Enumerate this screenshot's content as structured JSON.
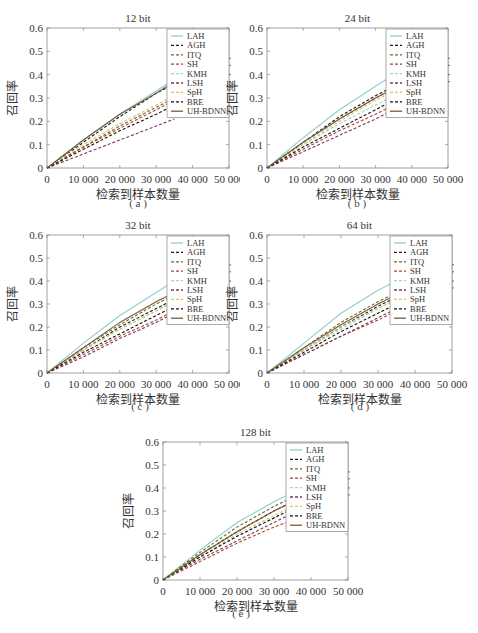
{
  "figure": {
    "legend_order": [
      "LAH",
      "AGH",
      "ITQ",
      "SH",
      "KMH",
      "LSH",
      "SpH",
      "BRE",
      "UH-BDNN"
    ]
  },
  "styles": {
    "LAH": {
      "color": "#8fcfc8",
      "dash": ""
    },
    "AGH": {
      "color": "#1a1a1a",
      "dash": "3,2"
    },
    "ITQ": {
      "color": "#6b6b2a",
      "dash": "3,2"
    },
    "SH": {
      "color": "#b0402a",
      "dash": "3,2"
    },
    "KMH": {
      "color": "#9fd2d8",
      "dash": "3,2"
    },
    "LSH": {
      "color": "#7a3a5a",
      "dash": "3,2"
    },
    "SpH": {
      "color": "#d6c66a",
      "dash": "3,2"
    },
    "BRE": {
      "color": "#111111",
      "dash": "3,2"
    },
    "UH-BDNN": {
      "color": "#7a5a3a",
      "dash": ""
    }
  },
  "chart_data": [
    {
      "type": "line",
      "panel": "a",
      "title": "12 bit",
      "caption": "( a )",
      "xlabel": "检索到样本数量",
      "ylabel": "召回率",
      "xlim": [
        0,
        50000
      ],
      "ylim": [
        0,
        0.6
      ],
      "xticks": [
        "0",
        "10 000",
        "20 000",
        "30 000",
        "40 000",
        "50 000"
      ],
      "yticks": [
        "0",
        "0.1",
        "0.2",
        "0.3",
        "0.4",
        "0.5",
        "0.6"
      ],
      "x": [
        0,
        10000,
        20000,
        30000,
        35000
      ],
      "series": [
        {
          "name": "LAH",
          "values": [
            0,
            0.12,
            0.23,
            0.33,
            0.38
          ]
        },
        {
          "name": "AGH",
          "values": [
            0,
            0.11,
            0.22,
            0.32,
            0.36
          ]
        },
        {
          "name": "ITQ",
          "values": [
            0,
            0.09,
            0.18,
            0.26,
            0.3
          ]
        },
        {
          "name": "SH",
          "values": [
            0,
            0.09,
            0.17,
            0.25,
            0.29
          ]
        },
        {
          "name": "KMH",
          "values": [
            0,
            0.12,
            0.23,
            0.33,
            0.37
          ]
        },
        {
          "name": "LSH",
          "values": [
            0,
            0.06,
            0.12,
            0.18,
            0.21
          ]
        },
        {
          "name": "SpH",
          "values": [
            0,
            0.1,
            0.19,
            0.27,
            0.31
          ]
        },
        {
          "name": "BRE",
          "values": [
            0,
            0.08,
            0.16,
            0.23,
            0.27
          ]
        },
        {
          "name": "UH-BDNN",
          "values": [
            0,
            0.12,
            0.23,
            0.32,
            0.37
          ]
        }
      ]
    },
    {
      "type": "line",
      "panel": "b",
      "title": "24 bit",
      "caption": "( b )",
      "xlabel": "检索到样本数量",
      "ylabel": "召回率",
      "xlim": [
        0,
        50000
      ],
      "ylim": [
        0,
        0.6
      ],
      "xticks": [
        "0",
        "10 000",
        "20 000",
        "30 000",
        "40 000",
        "50 000"
      ],
      "yticks": [
        "0",
        "0.1",
        "0.2",
        "0.3",
        "0.4",
        "0.5",
        "0.6"
      ],
      "x": [
        0,
        10000,
        20000,
        30000,
        35000
      ],
      "series": [
        {
          "name": "LAH",
          "values": [
            0,
            0.13,
            0.25,
            0.35,
            0.4
          ]
        },
        {
          "name": "AGH",
          "values": [
            0,
            0.11,
            0.22,
            0.31,
            0.35
          ]
        },
        {
          "name": "ITQ",
          "values": [
            0,
            0.11,
            0.21,
            0.3,
            0.34
          ]
        },
        {
          "name": "SH",
          "values": [
            0,
            0.08,
            0.16,
            0.23,
            0.27
          ]
        },
        {
          "name": "KMH",
          "values": [
            0,
            0.1,
            0.19,
            0.27,
            0.31
          ]
        },
        {
          "name": "LSH",
          "values": [
            0,
            0.07,
            0.14,
            0.21,
            0.25
          ]
        },
        {
          "name": "SpH",
          "values": [
            0,
            0.1,
            0.2,
            0.29,
            0.33
          ]
        },
        {
          "name": "BRE",
          "values": [
            0,
            0.09,
            0.17,
            0.25,
            0.29
          ]
        },
        {
          "name": "UH-BDNN",
          "values": [
            0,
            0.11,
            0.21,
            0.3,
            0.34
          ]
        }
      ]
    },
    {
      "type": "line",
      "panel": "c",
      "title": "32 bit",
      "caption": "( c )",
      "xlabel": "检索到样本数量",
      "ylabel": "召回率",
      "xlim": [
        0,
        50000
      ],
      "ylim": [
        0,
        0.6
      ],
      "xticks": [
        "0",
        "10 000",
        "20 000",
        "30 000",
        "40 000",
        "50 000"
      ],
      "yticks": [
        "0",
        "0.1",
        "0.2",
        "0.3",
        "0.4",
        "0.5",
        "0.6"
      ],
      "x": [
        0,
        10000,
        20000,
        30000,
        35000
      ],
      "series": [
        {
          "name": "LAH",
          "values": [
            0,
            0.13,
            0.25,
            0.35,
            0.4
          ]
        },
        {
          "name": "AGH",
          "values": [
            0,
            0.1,
            0.2,
            0.28,
            0.32
          ]
        },
        {
          "name": "ITQ",
          "values": [
            0,
            0.11,
            0.21,
            0.3,
            0.34
          ]
        },
        {
          "name": "SH",
          "values": [
            0,
            0.08,
            0.16,
            0.23,
            0.27
          ]
        },
        {
          "name": "KMH",
          "values": [
            0,
            0.1,
            0.19,
            0.27,
            0.31
          ]
        },
        {
          "name": "LSH",
          "values": [
            0,
            0.07,
            0.15,
            0.22,
            0.26
          ]
        },
        {
          "name": "SpH",
          "values": [
            0,
            0.1,
            0.19,
            0.27,
            0.31
          ]
        },
        {
          "name": "BRE",
          "values": [
            0,
            0.09,
            0.17,
            0.25,
            0.29
          ]
        },
        {
          "name": "UH-BDNN",
          "values": [
            0,
            0.11,
            0.22,
            0.31,
            0.35
          ]
        }
      ]
    },
    {
      "type": "line",
      "panel": "d",
      "title": "64 bit",
      "caption": "( d )",
      "xlabel": "检索到样本数量",
      "ylabel": "召回率",
      "xlim": [
        0,
        50000
      ],
      "ylim": [
        0,
        0.6
      ],
      "xticks": [
        "0",
        "10 000",
        "20 000",
        "30 000",
        "40 000",
        "50 000"
      ],
      "yticks": [
        "0",
        "0.1",
        "0.2",
        "0.3",
        "0.4",
        "0.5",
        "0.6"
      ],
      "x": [
        0,
        10000,
        20000,
        30000,
        35000
      ],
      "series": [
        {
          "name": "LAH",
          "values": [
            0,
            0.13,
            0.26,
            0.36,
            0.4
          ]
        },
        {
          "name": "AGH",
          "values": [
            0,
            0.1,
            0.2,
            0.29,
            0.33
          ]
        },
        {
          "name": "ITQ",
          "values": [
            0,
            0.11,
            0.22,
            0.31,
            0.35
          ]
        },
        {
          "name": "SH",
          "values": [
            0,
            0.08,
            0.16,
            0.23,
            0.27
          ]
        },
        {
          "name": "KMH",
          "values": [
            0,
            0.1,
            0.19,
            0.28,
            0.32
          ]
        },
        {
          "name": "LSH",
          "values": [
            0,
            0.08,
            0.16,
            0.24,
            0.28
          ]
        },
        {
          "name": "SpH",
          "values": [
            0,
            0.1,
            0.2,
            0.28,
            0.32
          ]
        },
        {
          "name": "BRE",
          "values": [
            0,
            0.09,
            0.18,
            0.26,
            0.3
          ]
        },
        {
          "name": "UH-BDNN",
          "values": [
            0,
            0.11,
            0.21,
            0.3,
            0.34
          ]
        }
      ]
    },
    {
      "type": "line",
      "panel": "e",
      "title": "128 bit",
      "caption": "( e )",
      "xlabel": "检索到样本数量",
      "ylabel": "召回率",
      "xlim": [
        0,
        50000
      ],
      "ylim": [
        0,
        0.6
      ],
      "xticks": [
        "0",
        "10 000",
        "20 000",
        "30 000",
        "40 000",
        "50 000"
      ],
      "yticks": [
        "0",
        "0.1",
        "0.2",
        "0.3",
        "0.4",
        "0.5",
        "0.6"
      ],
      "x": [
        0,
        10000,
        20000,
        30000,
        35000
      ],
      "series": [
        {
          "name": "LAH",
          "values": [
            0,
            0.13,
            0.25,
            0.34,
            0.38
          ]
        },
        {
          "name": "AGH",
          "values": [
            0,
            0.11,
            0.21,
            0.3,
            0.34
          ]
        },
        {
          "name": "ITQ",
          "values": [
            0,
            0.12,
            0.23,
            0.32,
            0.36
          ]
        },
        {
          "name": "SH",
          "values": [
            0,
            0.08,
            0.16,
            0.23,
            0.26
          ]
        },
        {
          "name": "KMH",
          "values": [
            0,
            0.1,
            0.19,
            0.27,
            0.31
          ]
        },
        {
          "name": "LSH",
          "values": [
            0,
            0.09,
            0.17,
            0.25,
            0.29
          ]
        },
        {
          "name": "SpH",
          "values": [
            0,
            0.1,
            0.2,
            0.28,
            0.32
          ]
        },
        {
          "name": "BRE",
          "values": [
            0,
            0.1,
            0.19,
            0.27,
            0.31
          ]
        },
        {
          "name": "UH-BDNN",
          "values": [
            0,
            0.11,
            0.21,
            0.3,
            0.34
          ]
        }
      ]
    }
  ]
}
